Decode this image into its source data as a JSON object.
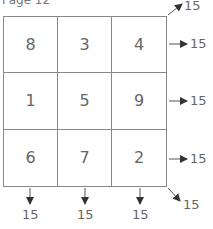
{
  "title": "Page 12",
  "grid": {
    "rows": [
      [
        8,
        3,
        4
      ],
      [
        1,
        5,
        9
      ],
      [
        6,
        7,
        2
      ]
    ]
  },
  "sums": {
    "diagonal_up": "15",
    "rows": [
      "15",
      "15",
      "15"
    ],
    "columns": [
      "15",
      "15",
      "15"
    ],
    "diagonal_down": "15"
  }
}
